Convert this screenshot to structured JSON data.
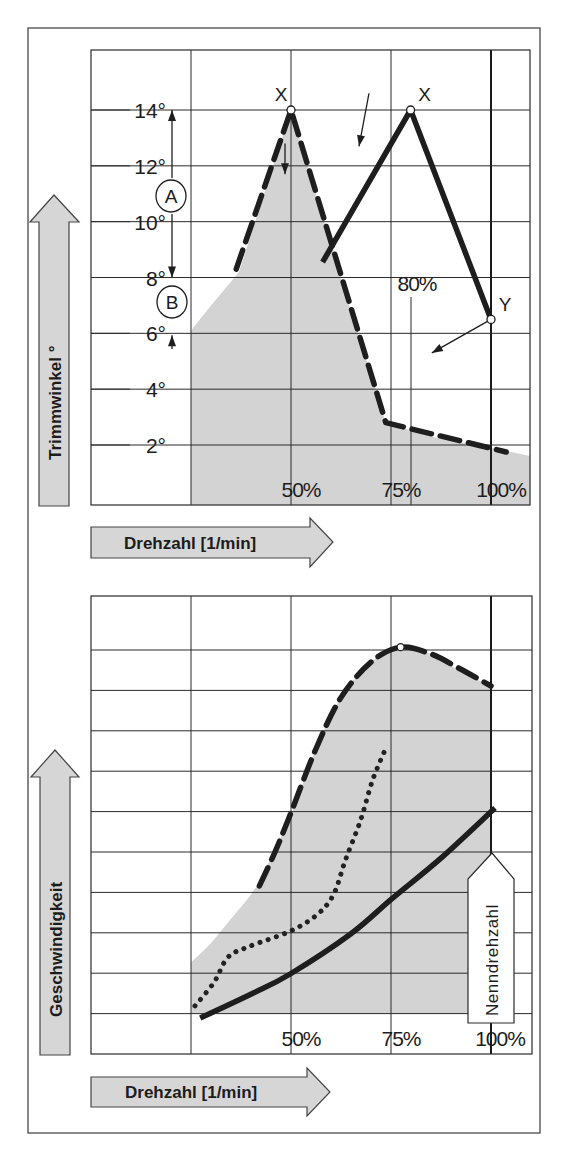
{
  "chart_data": [
    {
      "type": "line",
      "title": "",
      "ylabel": "Trimmwinkel °",
      "xlabel": "Drehzahl [1/min]",
      "x_unit": "% Nenndrehzahl",
      "xlim": [
        0,
        110
      ],
      "ylim": [
        0,
        16.2
      ],
      "grid": true,
      "x_gridlines": [
        25,
        50,
        75,
        100
      ],
      "x_tick_labels": [
        {
          "value": 50,
          "label": "50%"
        },
        {
          "value": 75,
          "label": "75%"
        },
        {
          "value": 100,
          "label": "100%"
        }
      ],
      "y_gridlines": [
        2,
        4,
        6,
        8,
        10,
        12,
        14
      ],
      "y_tick_labels": [
        {
          "value": 14,
          "label": "14°"
        },
        {
          "value": 12,
          "label": "12°"
        },
        {
          "value": 10,
          "label": "10°"
        },
        {
          "value": 8,
          "label": "8°"
        },
        {
          "value": 6,
          "label": "6°"
        },
        {
          "value": 4,
          "label": "4°"
        },
        {
          "value": 2,
          "label": "2°"
        }
      ],
      "reference_line": {
        "x": 80,
        "label": "80%",
        "from_y": 7.3
      },
      "shaded_area": {
        "x": [
          25,
          30,
          37,
          50,
          62,
          73.7,
          85,
          100,
          110
        ],
        "y": [
          6.1,
          7.0,
          8.2,
          14,
          8.2,
          2.8,
          2.3,
          1.9,
          1.6
        ]
      },
      "series": [
        {
          "name": "dashed",
          "style": "dashed",
          "x": [
            36.3,
            50,
            73.7,
            103.8
          ],
          "y": [
            8.3,
            14,
            2.8,
            1.75
          ]
        },
        {
          "name": "solid",
          "style": "solid",
          "x": [
            57.9,
            79.9,
            100
          ],
          "y": [
            8.55,
            14,
            6.5
          ]
        }
      ],
      "points": [
        {
          "label": "X",
          "x": 50,
          "y": 14
        },
        {
          "label": "X",
          "x": 79.9,
          "y": 14
        },
        {
          "label": "Y",
          "x": 100,
          "y": 6.5
        }
      ],
      "annotations": [
        {
          "label": "A",
          "range_y": [
            8,
            14
          ],
          "description": "double arrow between 14° and 8°"
        },
        {
          "label": "B",
          "range_y": [
            6,
            8
          ],
          "description": "arrows between 8° and 6°"
        },
        {
          "type": "arrow",
          "from": [
            48.5,
            12.8
          ],
          "to": [
            48.5,
            11.7
          ]
        },
        {
          "type": "arrow",
          "from": [
            69.5,
            14.6
          ],
          "to": [
            67.0,
            12.7
          ]
        },
        {
          "type": "arrow",
          "from": [
            100,
            6.5
          ],
          "to": [
            85.2,
            5.3
          ]
        }
      ]
    },
    {
      "type": "line",
      "title": "",
      "ylabel": "Geschwindigkeit",
      "xlabel": "Drehzahl [1/min]",
      "x_unit": "% Nenndrehzahl",
      "y_unit": "grid divisions (unlabeled)",
      "xlim": [
        0,
        110
      ],
      "ylim": [
        0,
        11.3
      ],
      "grid": true,
      "x_gridlines": [
        25,
        50,
        75,
        100
      ],
      "x_tick_labels": [
        {
          "value": 50,
          "label": "50%"
        },
        {
          "value": 75,
          "label": "75%"
        },
        {
          "value": 100,
          "label": "100%"
        }
      ],
      "y_gridlines": [
        1,
        2,
        3,
        4,
        5,
        6,
        7,
        8,
        9,
        10
      ],
      "shaded_area": {
        "x": [
          25,
          30,
          35,
          40,
          43,
          50,
          56,
          62.4,
          70,
          77.4,
          85,
          92,
          100,
          100,
          25
        ],
        "y": [
          2.27,
          2.75,
          3.35,
          3.95,
          4.45,
          5.92,
          7.5,
          8.81,
          9.7,
          10.07,
          9.9,
          9.5,
          9.1,
          1.0,
          1.0
        ]
      },
      "series": [
        {
          "name": "dashed",
          "style": "dashed",
          "x": [
            42.1,
            46,
            49.8,
            56,
            62.4,
            70,
            77.4,
            85,
            92,
            100
          ],
          "y": [
            4.16,
            5.0,
            5.92,
            7.5,
            8.81,
            9.7,
            10.07,
            9.9,
            9.55,
            9.11
          ]
        },
        {
          "name": "dotted",
          "style": "dotted",
          "x": [
            26,
            30.8,
            34.3,
            39.8,
            49.8,
            56.4,
            60.6,
            63.6,
            67.4,
            70.4,
            73.7
          ],
          "y": [
            1.19,
            1.78,
            2.4,
            2.67,
            3.04,
            3.44,
            3.94,
            4.8,
            5.79,
            6.78,
            7.57
          ]
        },
        {
          "name": "solid",
          "style": "solid",
          "x": [
            27.3,
            40.6,
            49.8,
            64.9,
            75.4,
            87.5,
            101
          ],
          "y": [
            0.89,
            1.51,
            1.98,
            2.97,
            3.86,
            4.85,
            6.09
          ]
        }
      ],
      "points": [
        {
          "label": "",
          "x": 77.4,
          "y": 10.07
        }
      ],
      "annotations": [
        {
          "label": "Nenndrehzahl",
          "x": 100,
          "description": "rated speed marker at 100%"
        }
      ]
    }
  ],
  "top_chart": {
    "y_axis_label": "Trimmwinkel °",
    "x_axis_label": "Drehzahl [1/min]",
    "y_ticks": [
      "14°",
      "12°",
      "10°",
      "8°",
      "6°",
      "4°",
      "2°"
    ],
    "x_ticks": [
      "50%",
      "75%",
      "100%"
    ],
    "ref_label": "80%",
    "point_labels": [
      "X",
      "X",
      "Y"
    ],
    "circle_labels": [
      "A",
      "B"
    ]
  },
  "bottom_chart": {
    "y_axis_label": "Geschwindigkeit",
    "x_axis_label": "Drehzahl [1/min]",
    "x_ticks": [
      "50%",
      "75%",
      "100%"
    ],
    "rated_label": "Nenndrehzahl"
  }
}
